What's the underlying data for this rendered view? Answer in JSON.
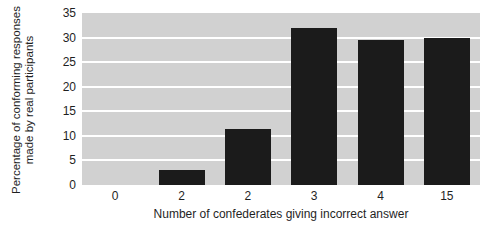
{
  "chart_data": {
    "type": "bar",
    "title": "",
    "categories": [
      "0",
      "2",
      "2",
      "3",
      "4",
      "15"
    ],
    "values": [
      0,
      3,
      11.5,
      32,
      29.5,
      30
    ],
    "xlabel": "Number of confederates giving incorrect answer",
    "ylabel_line1": "Percentage of conforming responses",
    "ylabel_line2": "made by real participants",
    "ylim": [
      0,
      35
    ],
    "yticks": [
      0,
      5,
      10,
      15,
      20,
      25,
      30,
      35
    ],
    "grid": "horizontal",
    "legend": "none",
    "colors": {
      "bar": "#1b1b1b",
      "plot_background": "#d1d1d1",
      "gridline": "#ffffff",
      "text": "#1f1f1f",
      "page_background": "#ffffff"
    }
  }
}
